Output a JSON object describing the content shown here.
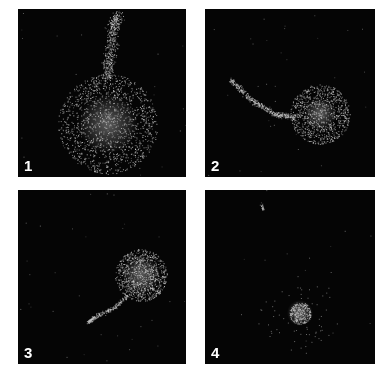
{
  "figure": {
    "background": "#ffffff",
    "panel_color": "#050505",
    "particle_color": "#c8c8c8",
    "panels": [
      {
        "label": "1",
        "x": 18,
        "y": 9,
        "w": 168,
        "h": 168
      },
      {
        "label": "2",
        "x": 205,
        "y": 9,
        "w": 170,
        "h": 168
      },
      {
        "label": "3",
        "x": 18,
        "y": 190,
        "w": 168,
        "h": 174
      },
      {
        "label": "4",
        "x": 205,
        "y": 190,
        "w": 170,
        "h": 174
      }
    ]
  }
}
